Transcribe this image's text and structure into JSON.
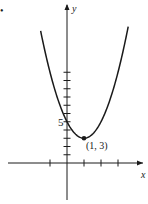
{
  "chart_data": {
    "type": "line",
    "title": "",
    "xlabel": "x",
    "ylabel": "y",
    "function": "y = 2(x - 1)^2 + 3",
    "series": [
      {
        "name": "parabola",
        "coefficients": {
          "a": 2,
          "h": 1,
          "k": 3
        },
        "x_range": [
          -1.55,
          3.6
        ]
      }
    ],
    "points": [
      {
        "x": 1,
        "y": 3,
        "label": "(1, 3)"
      }
    ],
    "x_ticks": [
      -1,
      1,
      2,
      3
    ],
    "y_ticks": [
      1,
      2,
      3,
      4,
      5,
      6,
      7,
      8,
      9,
      10,
      11
    ],
    "y_tick_labels": [
      {
        "value": 5,
        "label": "5"
      }
    ],
    "xlim": [
      -3,
      4
    ],
    "ylim": [
      -5,
      18.5
    ],
    "grid": false,
    "legend": "none",
    "colors": {
      "ink": "#1a1a1a",
      "background": "#ffffff"
    },
    "marker": "•"
  }
}
